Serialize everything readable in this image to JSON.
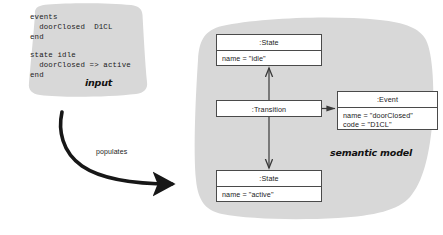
{
  "diagram": {
    "title_labels": {
      "input": "input",
      "semantic_model": "semantic model",
      "populates": "populates"
    },
    "input_code": {
      "events_block": "events\n  doorClosed  D1CL\nend",
      "state_block": "state idle\n  doorClosed => active\nend"
    },
    "objects": [
      {
        "id": "state-idle",
        "title": ":State",
        "attributes": [
          "name = \"idle\""
        ]
      },
      {
        "id": "transition",
        "title": ":Transition",
        "attributes": []
      },
      {
        "id": "event",
        "title": ":Event",
        "attributes": [
          "name = \"doorClosed\"",
          "code = \"D1CL\""
        ]
      },
      {
        "id": "state-active",
        "title": ":State",
        "attributes": [
          "name = \"active\""
        ]
      }
    ],
    "connections": [
      {
        "from": "transition",
        "to": "state-idle",
        "direction": "up"
      },
      {
        "from": "transition",
        "to": "state-active",
        "direction": "down"
      },
      {
        "from": "transition",
        "to": "event",
        "direction": "right"
      }
    ],
    "colors": {
      "blob_fill": "#d8d8d8",
      "box_fill": "#ffffff",
      "box_stroke": "#4a4a4a",
      "arrow": "#3a3a3a",
      "text": "#1a1a1a",
      "background": "#ffffff"
    }
  }
}
